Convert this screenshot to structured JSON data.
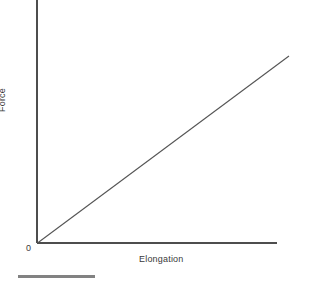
{
  "figure": {
    "width": 313,
    "height": 285,
    "background": "#ffffff"
  },
  "labels": {
    "y_axis": "Force",
    "x_axis": "Elongation",
    "origin": "0"
  },
  "colors": {
    "axis": "#4d4d4d",
    "data_line": "#555555",
    "text": "#3a3a3a",
    "bottom_bar": "#828282"
  },
  "chart_data": {
    "type": "line",
    "title": "",
    "subtitle": "",
    "xlabel": "Elongation",
    "ylabel": "Force",
    "x": [
      0,
      1
    ],
    "series": [
      {
        "name": "Force vs Elongation",
        "values": [
          0,
          1
        ]
      }
    ],
    "xlim": [
      0,
      1
    ],
    "ylim": [
      0,
      1
    ],
    "grid": false,
    "legend": "none",
    "xticks": [
      "0"
    ],
    "yticks": [],
    "annotations": [
      {
        "text": "0",
        "x": 0,
        "y": 0,
        "note": "origin tick label at axis intersection"
      }
    ]
  },
  "geometry": {
    "origin": {
      "x": 37,
      "y": 243
    },
    "y_axis_top": {
      "x": 37,
      "y": 0
    },
    "x_axis_right": {
      "x": 277,
      "y": 243
    },
    "data_line_end": {
      "x": 289,
      "y": 56
    },
    "bottom_bar": {
      "x": 18,
      "y": 275,
      "width": 77,
      "height": 3
    }
  }
}
